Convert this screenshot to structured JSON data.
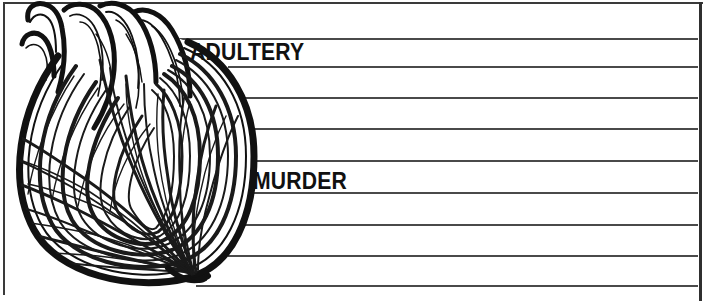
{
  "image": {
    "kind": "line-art-illustration",
    "subject": "onion cross-section on ruled notepaper",
    "background_color": "#ffffff",
    "ink_color": "#111111",
    "rule_color": "#4a4a4a",
    "border_color": "#3a3a3a"
  },
  "panel": {
    "name": "ruled-paper-panel",
    "width": 707,
    "height": 305,
    "rules": [
      {
        "y": 38,
        "x_start": 160,
        "x_end": 698
      },
      {
        "y": 66,
        "x_start": 228,
        "x_end": 698
      },
      {
        "y": 97,
        "x_start": 243,
        "x_end": 698
      },
      {
        "y": 128,
        "x_start": 250,
        "x_end": 698
      },
      {
        "y": 160,
        "x_start": 252,
        "x_end": 698
      },
      {
        "y": 192,
        "x_start": 250,
        "x_end": 698
      },
      {
        "y": 224,
        "x_start": 243,
        "x_end": 698
      },
      {
        "y": 255,
        "x_start": 228,
        "x_end": 698
      },
      {
        "y": 285,
        "x_start": 196,
        "x_end": 698
      }
    ],
    "rule_count": 9
  },
  "labels": {
    "adultery": "ADULTERY",
    "murder": "MURDER"
  },
  "illustration": {
    "name": "onion-illustration",
    "description": "halved onion drawn in bold black outline with many concentric layer lines radiating from a root point at the bottom and sprout stalks at the top left",
    "bulb_outline_color": "#111111",
    "layer_line_color": "#1a1a1a"
  }
}
